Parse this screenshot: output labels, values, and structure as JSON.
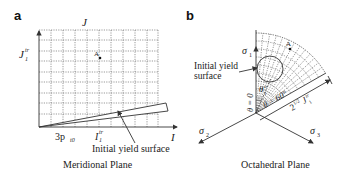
{
  "panel_a": {
    "label": "a",
    "y_axis_label": "J",
    "x_axis_label": "I",
    "y_tick": "J",
    "y_tick_sub": "1",
    "y_tick_sup": "tr",
    "x_tick_1": "3p",
    "x_tick_1_sub": "t0",
    "x_tick_2": "I",
    "x_tick_2_sub": "1",
    "x_tick_2_sup": "tr",
    "point_label": "A",
    "annotation": "Initial yield surface",
    "caption": "Meridional Plane"
  },
  "panel_b": {
    "label": "b",
    "sigma1": "σ",
    "sigma1_sub": "1",
    "sigma2": "σ",
    "sigma2_sub": "2",
    "sigma3": "σ",
    "sigma3_sub": "3",
    "point_label": "A",
    "annotation_line1": "Initial yield",
    "annotation_line2": "surface",
    "theta_tr": "θ",
    "theta_tr_sub": "1",
    "theta_tr_sup": "tr",
    "theta_zero": "θ = 0",
    "theta_sixty": "θ = 60°",
    "radius_label": "2",
    "radius_sup": "1/2",
    "radius_J": "J",
    "radius_J_sub": "1",
    "radius_J_sup": "tr",
    "caption": "Octahedral Plane"
  }
}
